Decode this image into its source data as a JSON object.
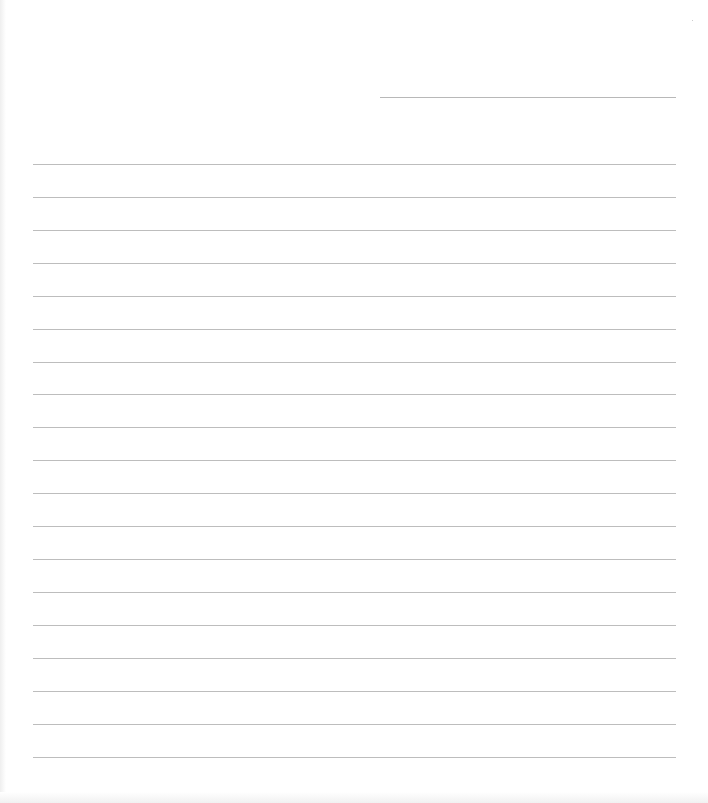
{
  "document": {
    "type": "blank lined letter page",
    "header_line": {
      "left": 380,
      "top": 97,
      "width": 296
    },
    "ruled_lines": {
      "left": 33,
      "right": 676,
      "tops": [
        164,
        197,
        230,
        263,
        296,
        329,
        362,
        394,
        427,
        460,
        493,
        526,
        559,
        592,
        625,
        658,
        691,
        724,
        757
      ]
    },
    "line_color": "#bdbdbd",
    "background_color": "#ffffff"
  }
}
